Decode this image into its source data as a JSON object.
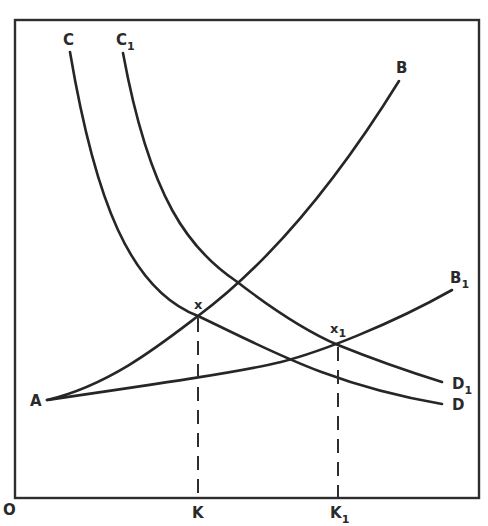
{
  "diagram": {
    "origin_label": "O",
    "curves": [
      {
        "id": "C",
        "start_label": "C",
        "end_label": "D",
        "end_sub": ""
      },
      {
        "id": "C1",
        "start_label": "C",
        "start_sub": "1",
        "end_label": "D",
        "end_sub": "1"
      },
      {
        "id": "AB",
        "start_label": "A",
        "end_label": "B",
        "end_sub": ""
      },
      {
        "id": "AB1",
        "end_label": "B",
        "end_sub": "1"
      }
    ],
    "points": [
      {
        "label": "x",
        "sub": ""
      },
      {
        "label": "x",
        "sub": "1"
      }
    ],
    "axis_ticks": [
      {
        "label": "K",
        "sub": ""
      },
      {
        "label": "K",
        "sub": "1"
      }
    ]
  }
}
